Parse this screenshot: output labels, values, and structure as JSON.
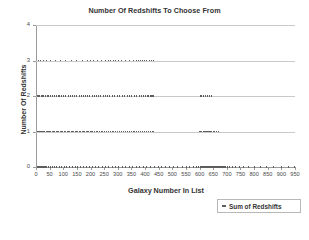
{
  "chart_data": {
    "type": "scatter",
    "title": "Number Of Redshifts To Choose From",
    "xlabel": "Galaxy Number In List",
    "ylabel": "Number Of Redshifts",
    "xlim": [
      0,
      950
    ],
    "ylim": [
      0,
      4
    ],
    "grid": true,
    "legend_position": "bottom-right",
    "xticks": [
      0,
      50,
      100,
      150,
      200,
      250,
      300,
      350,
      400,
      450,
      500,
      550,
      600,
      650,
      700,
      750,
      800,
      850,
      900,
      950
    ],
    "xtick_labels": [
      "0",
      "50",
      "100",
      "150",
      "200",
      "250",
      "300",
      "350",
      "400",
      "450",
      "500",
      "550",
      "600",
      "650",
      "700",
      "750",
      "800",
      "850",
      "900",
      "950"
    ],
    "yticks": [
      0,
      1,
      2,
      3,
      4
    ],
    "ytick_labels": [
      "0",
      "1",
      "2",
      "3",
      "4"
    ],
    "series": [
      {
        "name": "Sum of Redshifts",
        "marker": "dash",
        "color": "#5d5d5d",
        "points": [
          [
            2,
            0
          ],
          [
            4,
            0
          ],
          [
            6,
            0
          ],
          [
            8,
            0
          ],
          [
            9,
            0
          ],
          [
            11,
            0
          ],
          [
            13,
            0
          ],
          [
            15,
            0
          ],
          [
            17,
            0
          ],
          [
            19,
            0
          ],
          [
            21,
            0
          ],
          [
            23,
            0
          ],
          [
            26,
            0
          ],
          [
            29,
            0
          ],
          [
            33,
            0
          ],
          [
            38,
            0
          ],
          [
            44,
            0
          ],
          [
            51,
            0
          ],
          [
            58,
            0
          ],
          [
            66,
            0
          ],
          [
            74,
            0
          ],
          [
            83,
            0
          ],
          [
            92,
            0
          ],
          [
            101,
            0
          ],
          [
            111,
            0
          ],
          [
            121,
            0
          ],
          [
            131,
            0
          ],
          [
            142,
            0
          ],
          [
            152,
            0
          ],
          [
            163,
            0
          ],
          [
            173,
            0
          ],
          [
            184,
            0
          ],
          [
            195,
            0
          ],
          [
            206,
            0
          ],
          [
            218,
            0
          ],
          [
            229,
            0
          ],
          [
            241,
            0
          ],
          [
            253,
            0
          ],
          [
            265,
            0
          ],
          [
            277,
            0
          ],
          [
            289,
            0
          ],
          [
            301,
            0
          ],
          [
            314,
            0
          ],
          [
            327,
            0
          ],
          [
            340,
            0
          ],
          [
            353,
            0
          ],
          [
            366,
            0
          ],
          [
            379,
            0
          ],
          [
            392,
            0
          ],
          [
            405,
            0
          ],
          [
            418,
            0
          ],
          [
            432,
            0
          ],
          [
            446,
            0
          ],
          [
            460,
            0
          ],
          [
            474,
            0
          ],
          [
            489,
            0
          ],
          [
            504,
            0
          ],
          [
            519,
            0
          ],
          [
            534,
            0
          ],
          [
            549,
            0
          ],
          [
            563,
            0
          ],
          [
            575,
            0
          ],
          [
            586,
            0
          ],
          [
            594,
            0
          ],
          [
            600,
            0
          ],
          [
            604,
            0
          ],
          [
            608,
            0
          ],
          [
            611,
            0
          ],
          [
            614,
            0
          ],
          [
            617,
            0
          ],
          [
            620,
            0
          ],
          [
            623,
            0
          ],
          [
            626,
            0
          ],
          [
            629,
            0
          ],
          [
            632,
            0
          ],
          [
            635,
            0
          ],
          [
            638,
            0
          ],
          [
            641,
            0
          ],
          [
            644,
            0
          ],
          [
            647,
            0
          ],
          [
            650,
            0
          ],
          [
            653,
            0
          ],
          [
            656,
            0
          ],
          [
            659,
            0
          ],
          [
            662,
            0
          ],
          [
            665,
            0
          ],
          [
            668,
            0
          ],
          [
            671,
            0
          ],
          [
            674,
            0
          ],
          [
            677,
            0
          ],
          [
            680,
            0
          ],
          [
            683,
            0
          ],
          [
            686,
            0
          ],
          [
            690,
            0
          ],
          [
            695,
            0
          ],
          [
            701,
            0
          ],
          [
            709,
            0
          ],
          [
            719,
            0
          ],
          [
            731,
            0
          ],
          [
            745,
            0
          ],
          [
            761,
            0
          ],
          [
            779,
            0
          ],
          [
            799,
            0
          ],
          [
            821,
            0
          ],
          [
            845,
            0
          ],
          [
            871,
            0
          ],
          [
            899,
            0
          ],
          [
            925,
            0
          ],
          [
            945,
            0
          ],
          [
            3,
            1
          ],
          [
            5,
            1
          ],
          [
            7,
            1
          ],
          [
            10,
            1
          ],
          [
            13,
            1
          ],
          [
            16,
            1
          ],
          [
            19,
            1
          ],
          [
            22,
            1
          ],
          [
            25,
            1
          ],
          [
            28,
            1
          ],
          [
            31,
            1
          ],
          [
            35,
            1
          ],
          [
            39,
            1
          ],
          [
            43,
            1
          ],
          [
            47,
            1
          ],
          [
            52,
            1
          ],
          [
            57,
            1
          ],
          [
            62,
            1
          ],
          [
            67,
            1
          ],
          [
            72,
            1
          ],
          [
            77,
            1
          ],
          [
            82,
            1
          ],
          [
            87,
            1
          ],
          [
            92,
            1
          ],
          [
            97,
            1
          ],
          [
            102,
            1
          ],
          [
            107,
            1
          ],
          [
            112,
            1
          ],
          [
            117,
            1
          ],
          [
            122,
            1
          ],
          [
            127,
            1
          ],
          [
            132,
            1
          ],
          [
            137,
            1
          ],
          [
            142,
            1
          ],
          [
            147,
            1
          ],
          [
            152,
            1
          ],
          [
            157,
            1
          ],
          [
            162,
            1
          ],
          [
            167,
            1
          ],
          [
            172,
            1
          ],
          [
            177,
            1
          ],
          [
            182,
            1
          ],
          [
            187,
            1
          ],
          [
            192,
            1
          ],
          [
            197,
            1
          ],
          [
            202,
            1
          ],
          [
            207,
            1
          ],
          [
            213,
            1
          ],
          [
            219,
            1
          ],
          [
            225,
            1
          ],
          [
            231,
            1
          ],
          [
            237,
            1
          ],
          [
            243,
            1
          ],
          [
            249,
            1
          ],
          [
            256,
            1
          ],
          [
            263,
            1
          ],
          [
            270,
            1
          ],
          [
            277,
            1
          ],
          [
            284,
            1
          ],
          [
            291,
            1
          ],
          [
            298,
            1
          ],
          [
            305,
            1
          ],
          [
            312,
            1
          ],
          [
            319,
            1
          ],
          [
            326,
            1
          ],
          [
            333,
            1
          ],
          [
            340,
            1
          ],
          [
            347,
            1
          ],
          [
            354,
            1
          ],
          [
            361,
            1
          ],
          [
            368,
            1
          ],
          [
            375,
            1
          ],
          [
            382,
            1
          ],
          [
            389,
            1
          ],
          [
            396,
            1
          ],
          [
            403,
            1
          ],
          [
            410,
            1
          ],
          [
            417,
            1
          ],
          [
            424,
            1
          ],
          [
            430,
            1
          ],
          [
            598,
            1
          ],
          [
            603,
            1
          ],
          [
            607,
            1
          ],
          [
            611,
            1
          ],
          [
            615,
            1
          ],
          [
            619,
            1
          ],
          [
            623,
            1
          ],
          [
            627,
            1
          ],
          [
            631,
            1
          ],
          [
            635,
            1
          ],
          [
            639,
            1
          ],
          [
            643,
            1
          ],
          [
            648,
            1
          ],
          [
            654,
            1
          ],
          [
            661,
            1
          ],
          [
            668,
            1
          ],
          [
            4,
            2
          ],
          [
            8,
            2
          ],
          [
            12,
            2
          ],
          [
            17,
            2
          ],
          [
            22,
            2
          ],
          [
            27,
            2
          ],
          [
            33,
            2
          ],
          [
            39,
            2
          ],
          [
            45,
            2
          ],
          [
            51,
            2
          ],
          [
            58,
            2
          ],
          [
            65,
            2
          ],
          [
            72,
            2
          ],
          [
            79,
            2
          ],
          [
            86,
            2
          ],
          [
            93,
            2
          ],
          [
            100,
            2
          ],
          [
            108,
            2
          ],
          [
            116,
            2
          ],
          [
            124,
            2
          ],
          [
            132,
            2
          ],
          [
            140,
            2
          ],
          [
            148,
            2
          ],
          [
            156,
            2
          ],
          [
            164,
            2
          ],
          [
            172,
            2
          ],
          [
            180,
            2
          ],
          [
            188,
            2
          ],
          [
            196,
            2
          ],
          [
            204,
            2
          ],
          [
            212,
            2
          ],
          [
            220,
            2
          ],
          [
            228,
            2
          ],
          [
            236,
            2
          ],
          [
            244,
            2
          ],
          [
            252,
            2
          ],
          [
            260,
            2
          ],
          [
            269,
            2
          ],
          [
            278,
            2
          ],
          [
            287,
            2
          ],
          [
            296,
            2
          ],
          [
            305,
            2
          ],
          [
            314,
            2
          ],
          [
            323,
            2
          ],
          [
            332,
            2
          ],
          [
            341,
            2
          ],
          [
            350,
            2
          ],
          [
            359,
            2
          ],
          [
            368,
            2
          ],
          [
            377,
            2
          ],
          [
            386,
            2
          ],
          [
            394,
            2
          ],
          [
            401,
            2
          ],
          [
            407,
            2
          ],
          [
            412,
            2
          ],
          [
            417,
            2
          ],
          [
            421,
            2
          ],
          [
            425,
            2
          ],
          [
            429,
            2
          ],
          [
            600,
            2
          ],
          [
            606,
            2
          ],
          [
            612,
            2
          ],
          [
            619,
            2
          ],
          [
            626,
            2
          ],
          [
            634,
            2
          ],
          [
            643,
            2
          ],
          [
            6,
            3
          ],
          [
            14,
            3
          ],
          [
            25,
            3
          ],
          [
            38,
            3
          ],
          [
            53,
            3
          ],
          [
            70,
            3
          ],
          [
            88,
            3
          ],
          [
            107,
            3
          ],
          [
            127,
            3
          ],
          [
            148,
            3
          ],
          [
            170,
            3
          ],
          [
            186,
            3
          ],
          [
            197,
            3
          ],
          [
            208,
            3
          ],
          [
            222,
            3
          ],
          [
            238,
            3
          ],
          [
            252,
            3
          ],
          [
            263,
            3
          ],
          [
            272,
            3
          ],
          [
            281,
            3
          ],
          [
            290,
            3
          ],
          [
            300,
            3
          ],
          [
            312,
            3
          ],
          [
            326,
            3
          ],
          [
            342,
            3
          ],
          [
            356,
            3
          ],
          [
            366,
            3
          ],
          [
            374,
            3
          ],
          [
            381,
            3
          ],
          [
            388,
            3
          ],
          [
            396,
            3
          ],
          [
            404,
            3
          ],
          [
            413,
            3
          ],
          [
            422,
            3
          ],
          [
            430,
            3
          ]
        ]
      }
    ]
  },
  "legend": {
    "marker_name": "legend-dash-marker",
    "label": "Sum of Redshifts"
  }
}
